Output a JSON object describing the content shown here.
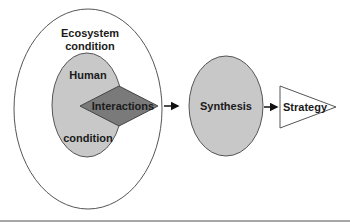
{
  "diagram": {
    "outer": {
      "label_line1": "Ecosystem",
      "label_line2": "condition",
      "fill": "#ffffff",
      "stroke": "#555555"
    },
    "inner": {
      "label_top": "Human",
      "label_bottom": "condition",
      "fill": "#c8c8c8",
      "stroke": "#555555"
    },
    "diamond": {
      "label": "Interactions",
      "fill": "#7a7a7a",
      "stroke": "#444444"
    },
    "synthesis": {
      "label": "Synthesis",
      "fill": "#c8c8c8",
      "stroke": "#555555"
    },
    "strategy": {
      "label": "Strategy",
      "fill": "#ffffff",
      "stroke": "#555555"
    },
    "flow": [
      "Interactions",
      "Synthesis",
      "Strategy"
    ]
  }
}
